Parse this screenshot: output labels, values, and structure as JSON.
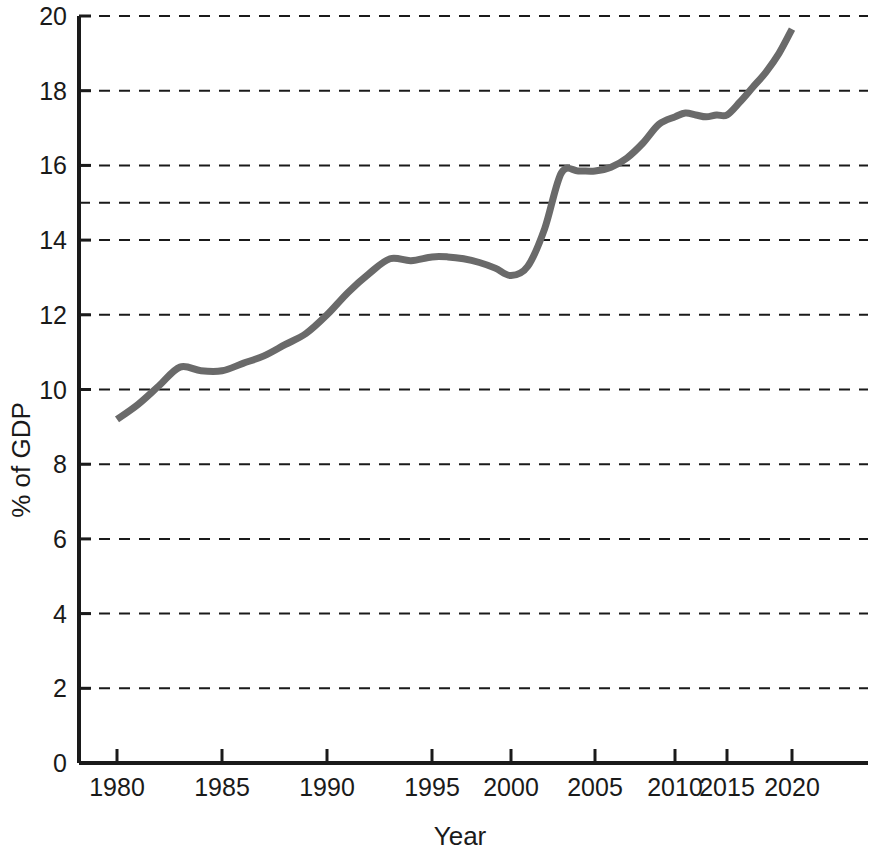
{
  "chart_data": {
    "type": "line",
    "title": "",
    "subtitle": "",
    "xlabel": "Year",
    "ylabel": "% of GDP",
    "xlim": [
      1979,
      2022.6
    ],
    "ylim": [
      0,
      20
    ],
    "grid": true,
    "grid_axis": "y",
    "grid_style": "dashed",
    "legend": false,
    "legend_position": "none",
    "x_tick_labels": [
      "1980",
      "1985",
      "1990",
      "1995",
      "2000",
      "2005",
      "2010",
      "2015",
      "2020"
    ],
    "x_ticks": [
      1980,
      1985,
      1990,
      1995,
      2000,
      2005,
      2010,
      2015,
      2020
    ],
    "y_tick_labels": [
      "0",
      "2",
      "4",
      "6",
      "8",
      "10",
      "12",
      "14",
      "16",
      "18",
      "20"
    ],
    "y_ticks": [
      0,
      2,
      4,
      6,
      8,
      10,
      12,
      14,
      16,
      18,
      20
    ],
    "y_gridline_values": [
      2,
      4,
      6,
      8,
      10,
      12,
      14,
      15,
      16,
      18,
      20
    ],
    "series": [
      {
        "name": "Health expenditure",
        "color": "#6a6a6a",
        "line_width": 7,
        "x": [
          1980,
          1981,
          1982,
          1983,
          1984,
          1985,
          1986,
          1987,
          1988,
          1989,
          1990,
          1991,
          1992,
          1993,
          1994,
          1995,
          1996,
          1997,
          1998,
          1999,
          2000,
          2001,
          2002,
          2003,
          2004,
          2005,
          2006,
          2007,
          2008,
          2009,
          2010,
          2011,
          2012,
          2013,
          2014,
          2015,
          2016,
          2017,
          2018,
          2019,
          2020
        ],
        "values": [
          9.2,
          9.6,
          10.1,
          10.6,
          10.5,
          10.5,
          10.7,
          10.9,
          11.2,
          11.5,
          12.0,
          12.6,
          13.1,
          13.5,
          13.45,
          13.55,
          13.55,
          13.5,
          13.4,
          13.25,
          13.05,
          13.3,
          14.3,
          15.8,
          15.85,
          15.85,
          15.95,
          16.2,
          16.6,
          17.1,
          17.3,
          17.4,
          17.35,
          17.3,
          17.35,
          17.35,
          17.7,
          18.1,
          18.5,
          19.0,
          19.65
        ]
      }
    ]
  },
  "figure": {
    "background_color": "#ffffff",
    "axis_color": "#1a1a1a",
    "text_color": "#1a1a1a"
  }
}
